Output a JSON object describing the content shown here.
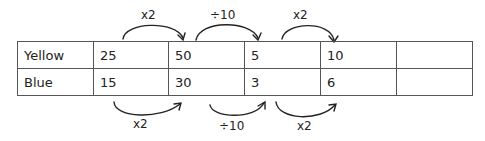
{
  "table": {
    "rows": [
      {
        "label": "Yellow",
        "cells": [
          "25",
          "50",
          "5",
          "10",
          ""
        ]
      },
      {
        "label": "Blue",
        "cells": [
          "15",
          "30",
          "3",
          "6",
          ""
        ]
      }
    ]
  },
  "annotations": {
    "top": [
      {
        "label": "x2",
        "from": "25",
        "to": "50"
      },
      {
        "label": "÷10",
        "from": "50",
        "to": "5"
      },
      {
        "label": "x2",
        "from": "5",
        "to": "10"
      }
    ],
    "bottom": [
      {
        "label": "x2",
        "from": "15",
        "to": "30"
      },
      {
        "label": "÷10",
        "from": "30",
        "to": "3"
      },
      {
        "label": "x2",
        "from": "3",
        "to": "6"
      }
    ]
  }
}
